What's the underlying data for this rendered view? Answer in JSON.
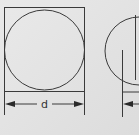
{
  "diagram": {
    "figures": [
      {
        "name": "circle-in-square",
        "dimension_label": "d"
      },
      {
        "name": "partial-right-figure"
      }
    ],
    "colors": {
      "background": "#e6e6e6",
      "line": "#3a3a3a"
    }
  }
}
